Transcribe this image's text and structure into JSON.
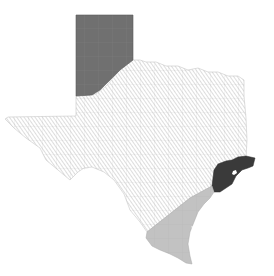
{
  "map": {
    "subject": "Texas",
    "regions": [
      {
        "name": "Panhandle",
        "fill": "#707070",
        "style": "solid-dark-gray"
      },
      {
        "name": "Central / West / North Texas",
        "fill": "#ffffff",
        "style": "diagonal-hatch",
        "hatch_color": "#b4b4b4"
      },
      {
        "name": "Houston / Upper Gulf Coast",
        "fill": "#3a3a3a",
        "style": "solid-black"
      },
      {
        "name": "South Texas / Lower Gulf Coast",
        "fill": "#c2c2c2",
        "style": "solid-light-gray"
      }
    ],
    "county_line_color": "#9a9a9a",
    "background": "#ffffff"
  }
}
